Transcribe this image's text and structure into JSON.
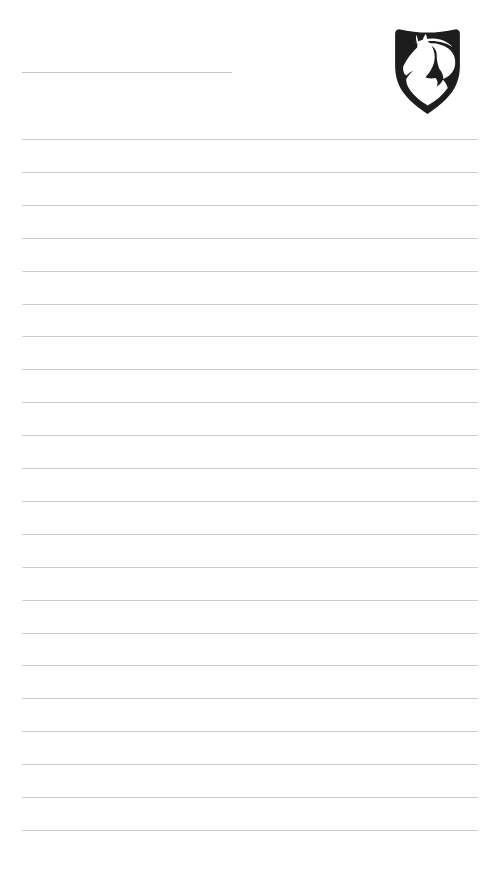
{
  "page": {
    "kind": "lined notepad page",
    "background_color": "#ffffff"
  },
  "header": {
    "title_rule": {
      "text": "",
      "color": "#c3c3c3"
    },
    "logo": {
      "name": "horse-head-shield",
      "shield_color": "#1d1d1d",
      "horse_color": "#ffffff"
    }
  },
  "body": {
    "ruled_lines": {
      "count": 22,
      "color": "#cdcdcd"
    }
  }
}
